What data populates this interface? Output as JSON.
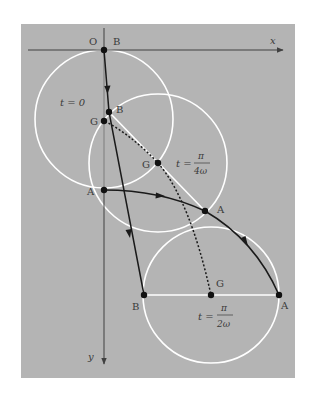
{
  "figure": {
    "background_color": "#b4b4b4",
    "axis_color": "#404040",
    "circle_color": "#ffffff",
    "path_color": "#1a1a1a"
  },
  "axes": {
    "origin_label": "O",
    "x_label": "x",
    "y_label": "y"
  },
  "labels": {
    "b_top": "B",
    "t0": "t = 0",
    "b_mid": "B",
    "g_t0": "G",
    "g_mid": "G",
    "a_t0": "A",
    "a_mid": "A",
    "b_end": "B",
    "g_end": "G",
    "a_end": "A",
    "t_quarter_prefix": "t =",
    "t_quarter_num": "π",
    "t_quarter_den": "4ω",
    "t_half_prefix": "t =",
    "t_half_num": "π",
    "t_half_den": "2ω"
  },
  "points": {
    "O": [
      104,
      50
    ],
    "B_t0": [
      104,
      50
    ],
    "G_t0": [
      104,
      119
    ],
    "A_t0": [
      104,
      190
    ],
    "B_mid": [
      109,
      112
    ],
    "G_mid": [
      158,
      163
    ],
    "A_mid": [
      205,
      211
    ],
    "B_end": [
      144,
      295
    ],
    "G_end": [
      211,
      295
    ],
    "A_end": [
      279,
      295
    ]
  },
  "circles": [
    {
      "name": "t=0",
      "center": [
        104,
        119
      ],
      "radius": 69
    },
    {
      "name": "t=pi/4w",
      "center": [
        158,
        163
      ],
      "radius": 69
    },
    {
      "name": "t=pi/2w",
      "center": [
        211,
        295
      ],
      "radius": 68
    }
  ]
}
